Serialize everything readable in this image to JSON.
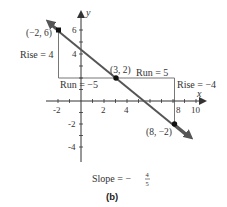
{
  "diagram": {
    "axes": {
      "x_label": "x",
      "y_label": "y",
      "x_ticks": [
        "-2",
        "2",
        "4",
        "8",
        "10"
      ],
      "y_ticks": [
        "6",
        "4",
        "-2",
        "-4"
      ]
    },
    "points": [
      {
        "label": "(−2, 6)",
        "x": -2,
        "y": 6
      },
      {
        "label": "(3, 2)",
        "x": 3,
        "y": 2
      },
      {
        "label": "(8, −2)",
        "x": 8,
        "y": -2
      }
    ],
    "annotations": {
      "rise_left": "Rise = 4",
      "run_left": "Run = −5",
      "run_right": "Run = 5",
      "rise_right": "Rise = −4"
    },
    "slope": {
      "prefix": "Slope = −",
      "numerator": "4",
      "denominator": "5"
    },
    "caption": "(b)",
    "colors": {
      "line": "#555555",
      "axis": "#333333",
      "guide": "#777777",
      "point": "#111111"
    }
  }
}
